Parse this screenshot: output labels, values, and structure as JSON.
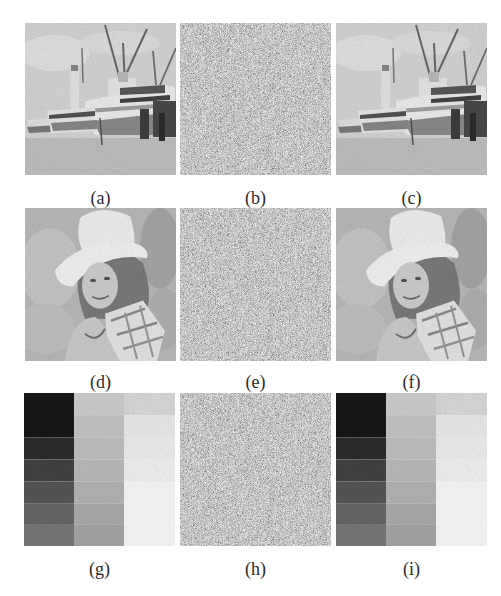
{
  "figure": {
    "rows": [
      {
        "panels": [
          {
            "label": "(a)",
            "kind": "boat",
            "x": 25,
            "y": 23
          },
          {
            "label": "(b)",
            "kind": "noise",
            "x": 180,
            "y": 23
          },
          {
            "label": "(c)",
            "kind": "boat",
            "x": 336,
            "y": 23
          }
        ],
        "label_y": 188
      },
      {
        "panels": [
          {
            "label": "(d)",
            "kind": "woman",
            "x": 25,
            "y": 208
          },
          {
            "label": "(e)",
            "kind": "noise",
            "x": 180,
            "y": 208
          },
          {
            "label": "(f)",
            "kind": "woman",
            "x": 336,
            "y": 208
          }
        ],
        "label_y": 372
      },
      {
        "panels": [
          {
            "label": "(g)",
            "kind": "blocks",
            "x": 24,
            "y": 393
          },
          {
            "label": "(h)",
            "kind": "noise",
            "x": 180,
            "y": 393
          },
          {
            "label": "(i)",
            "kind": "blocks",
            "x": 336,
            "y": 393
          }
        ],
        "label_y": 559
      }
    ],
    "block_colors": {
      "col1": [
        "#151515",
        "#151515",
        "#2e2e2e",
        "#444444",
        "#585858",
        "#6a6a6a",
        "#7b7b7b"
      ],
      "col2": [
        "#d2d2d2",
        "#c9c9c9",
        "#c4c4c4",
        "#bebebe",
        "#b8b8b8",
        "#afafaf",
        "#a9a9a9"
      ],
      "col3": [
        "#dedede",
        "#f0f0f0",
        "#f3f3f3",
        "#f6f6f6",
        "#fafafa",
        "#ffffff",
        "#ffffff"
      ]
    },
    "noise_base": "#9a9a9a"
  },
  "labels": {
    "a": "(a)",
    "b": "(b)",
    "c": "(c)",
    "d": "(d)",
    "e": "(e)",
    "f": "(f)",
    "g": "(g)",
    "h": "(h)",
    "i": "(i)"
  }
}
